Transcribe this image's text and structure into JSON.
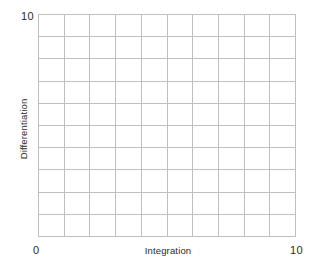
{
  "chart_data": {
    "type": "scatter",
    "title": "",
    "subtitle": "",
    "xlabel": "Integration",
    "ylabel": "Differentiation",
    "xlim": [
      0,
      10
    ],
    "ylim": [
      0,
      10
    ],
    "x_tick_labels": [
      "0",
      "10"
    ],
    "y_tick_labels": [
      "0",
      "10"
    ],
    "grid": true,
    "grid_columns": 10,
    "grid_rows": 10,
    "legend": null,
    "legend_position": "none",
    "series": [],
    "annotations": [],
    "note": "Empty 10x10 plotting grid with no plotted data points"
  },
  "axes": {
    "y_title": "Differentiation",
    "x_title": "Integration",
    "y_max_label": "10",
    "origin_label": "0",
    "x_max_label": "10"
  },
  "style": {
    "background_color": "#ffffff",
    "grid_line_color": "#bfbfbf",
    "text_color": "#2b2b2b"
  }
}
